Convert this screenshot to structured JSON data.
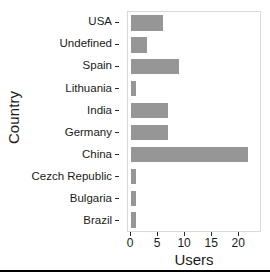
{
  "chart_data": {
    "type": "bar",
    "orientation": "horizontal",
    "title": "",
    "xlabel": "Users",
    "ylabel": "Country",
    "categories": [
      "USA",
      "Undefined",
      "Spain",
      "Lithuania",
      "India",
      "Germany",
      "China",
      "Cezch Republic",
      "Bulgaria",
      "Brazil"
    ],
    "values": [
      6,
      3,
      9,
      1,
      7,
      7,
      22,
      1,
      1,
      1
    ],
    "xlim": [
      0,
      24.2
    ],
    "xticks": [
      0,
      5,
      10,
      15,
      20
    ],
    "xtick_labels": [
      "0",
      "5",
      "10",
      "15",
      "20"
    ],
    "grid": false,
    "legend": false,
    "bar_color": "#969696",
    "panel_border_color": "#d9d9d9",
    "text_color": "#1a1a1a"
  },
  "axes": {
    "y_title": "Country",
    "x_title": "Users"
  }
}
